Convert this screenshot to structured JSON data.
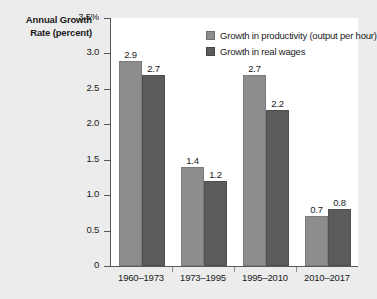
{
  "chart_data": {
    "type": "bar",
    "title": "",
    "ylabel": "Annual Growth Rate (percent)",
    "xlabel": "",
    "ylim": [
      0,
      3.5
    ],
    "ytick_labels": [
      "3.5%",
      "3.0",
      "2.5",
      "2.0",
      "1.5",
      "1.0",
      "0.5",
      "0"
    ],
    "ytick_values": [
      3.5,
      3.0,
      2.5,
      2.0,
      1.5,
      1.0,
      0.5,
      0
    ],
    "grid": false,
    "legend_position": "top-right",
    "categories": [
      "1960–1973",
      "1973–1995",
      "1995–2010",
      "2010–2017"
    ],
    "series": [
      {
        "name": "Growth in productivity (output per hour)",
        "color": "#8d8d8d",
        "values": [
          2.9,
          1.4,
          2.7,
          0.7
        ]
      },
      {
        "name": "Growth in real wages",
        "color": "#5b5b5b",
        "values": [
          2.7,
          1.2,
          2.2,
          0.8
        ]
      }
    ],
    "value_labels": [
      [
        "2.9",
        "2.7"
      ],
      [
        "1.4",
        "1.2"
      ],
      [
        "2.7",
        "2.2"
      ],
      [
        "0.7",
        "0.8"
      ]
    ]
  },
  "source_note": ""
}
